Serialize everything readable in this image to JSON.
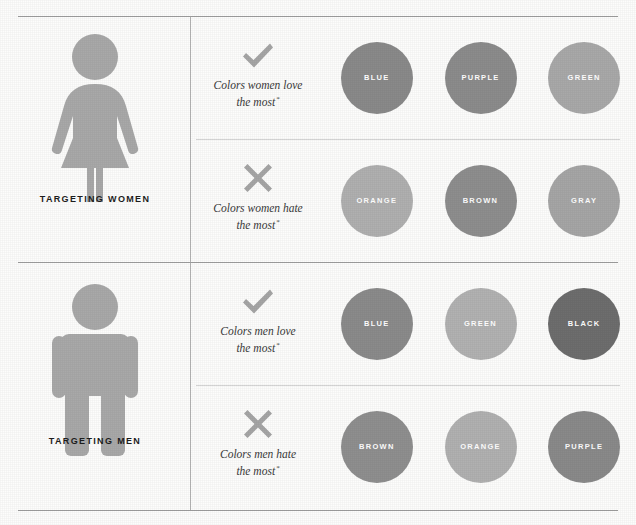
{
  "figure": {
    "ink_color": "#a8a8a8",
    "rule_color": "#8d8d8d"
  },
  "personas": [
    {
      "id": "women",
      "label": "TARGETING WOMEN",
      "pictogram": "female-pictogram-icon"
    },
    {
      "id": "men",
      "label": "TARGETING MEN",
      "pictogram": "male-pictogram-icon"
    }
  ],
  "rows": [
    {
      "id": "women-love",
      "persona": "women",
      "sentiment": "love",
      "icon": "checkmark-icon",
      "caption_line1": "Colors women love",
      "caption_line2": "the most",
      "footnote_marker": "*",
      "swatches": [
        {
          "label": "BLUE",
          "color": "#8a8a8a"
        },
        {
          "label": "PURPLE",
          "color": "#8c8c8c"
        },
        {
          "label": "GREEN",
          "color": "#a9a9a9"
        }
      ]
    },
    {
      "id": "women-hate",
      "persona": "women",
      "sentiment": "hate",
      "icon": "cross-icon",
      "caption_line1": "Colors women hate",
      "caption_line2": "the most",
      "footnote_marker": "*",
      "swatches": [
        {
          "label": "ORANGE",
          "color": "#b0b0b0"
        },
        {
          "label": "BROWN",
          "color": "#8e8e8e"
        },
        {
          "label": "GRAY",
          "color": "#a6a6a6"
        }
      ]
    },
    {
      "id": "men-love",
      "persona": "men",
      "sentiment": "love",
      "icon": "checkmark-icon",
      "caption_line1": "Colors men love",
      "caption_line2": "the most",
      "footnote_marker": "*",
      "swatches": [
        {
          "label": "BLUE",
          "color": "#8b8b8b"
        },
        {
          "label": "GREEN",
          "color": "#b2b2b2"
        },
        {
          "label": "BLACK",
          "color": "#6e6e6e"
        }
      ]
    },
    {
      "id": "men-hate",
      "persona": "men",
      "sentiment": "hate",
      "icon": "cross-icon",
      "caption_line1": "Colors men hate",
      "caption_line2": "the most",
      "footnote_marker": "*",
      "swatches": [
        {
          "label": "BROWN",
          "color": "#8f8f8f"
        },
        {
          "label": "ORANGE",
          "color": "#b1b1b1"
        },
        {
          "label": "PURPLE",
          "color": "#8a8a8a"
        }
      ]
    }
  ]
}
